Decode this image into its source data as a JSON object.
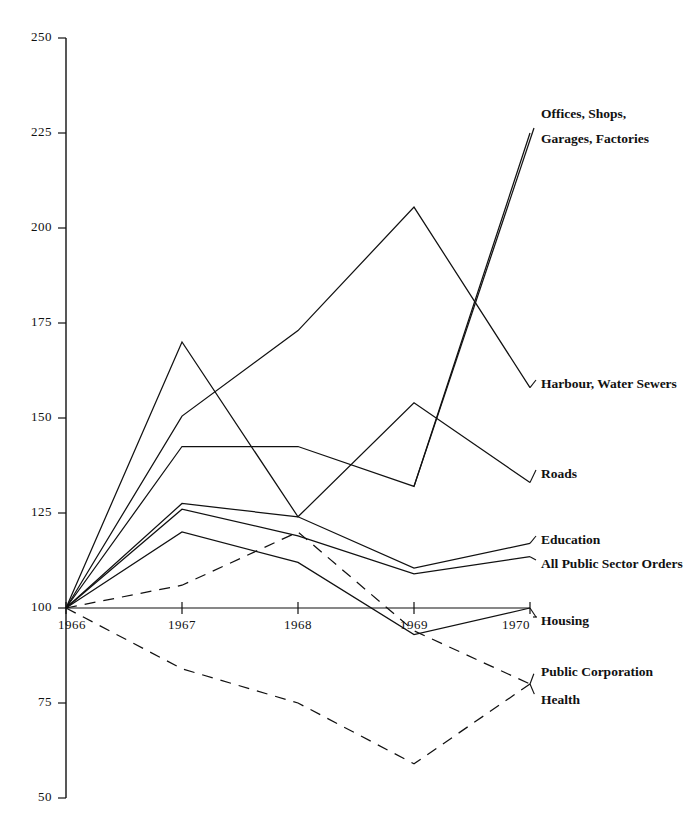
{
  "chart_data": {
    "type": "line",
    "title": "",
    "subtitle": "",
    "xlabel": "",
    "ylabel": "",
    "x": [
      "1966",
      "1967",
      "1968",
      "1969",
      "1970"
    ],
    "xlim": [
      1966,
      1970
    ],
    "ylim": [
      50,
      250
    ],
    "yticks": [
      50,
      75,
      100,
      125,
      150,
      175,
      200,
      225,
      250
    ],
    "xticks": [
      "1966",
      "1967",
      "1968",
      "1969",
      "1970"
    ],
    "grid": false,
    "legend_position": "right-inline-labels",
    "index_base": 100,
    "series": [
      {
        "name": "Offices, Shops, Garages, Factories",
        "label": "Offices, Shops,|Garages, Factories",
        "label_line1": "Offices, Shops,",
        "label_line2": "Garages, Factories",
        "style": "solid",
        "values": [
          100,
          142.5,
          142.5,
          132,
          225
        ],
        "color": "#111111"
      },
      {
        "name": "Harbour, Water Sewers",
        "label": "Harbour, Water Sewers",
        "style": "solid",
        "values": [
          100,
          150.5,
          173,
          205.5,
          158
        ],
        "color": "#111111"
      },
      {
        "name": "Roads",
        "label": "Roads",
        "style": "solid",
        "values": [
          100,
          170,
          124,
          154,
          133
        ],
        "color": "#111111"
      },
      {
        "name": "Education",
        "label": "Education",
        "style": "solid",
        "values": [
          100,
          127.5,
          124,
          110.5,
          117
        ],
        "color": "#111111"
      },
      {
        "name": "All Public Sector Orders",
        "label": "All Public Sector Orders",
        "style": "solid",
        "values": [
          100,
          126,
          119,
          109,
          113.5
        ],
        "color": "#111111"
      },
      {
        "name": "Housing",
        "label": "Housing",
        "style": "solid",
        "values": [
          100,
          120,
          112,
          93,
          100
        ],
        "color": "#111111"
      },
      {
        "name": "Public Corporation",
        "label": "Public Corporation",
        "style": "dashed",
        "values": [
          100,
          84,
          75,
          59,
          80
        ],
        "color": "#111111"
      },
      {
        "name": "Health",
        "label": "Health",
        "style": "dashed",
        "values": [
          100,
          106,
          120,
          94,
          80
        ],
        "color": "#111111"
      }
    ]
  },
  "axis": {
    "y_tick_labels": [
      "250",
      "225",
      "200",
      "175",
      "150",
      "125",
      "100",
      "75",
      "50"
    ],
    "x_tick_labels": [
      "1966",
      "1967",
      "1968",
      "1969",
      "1970"
    ]
  },
  "labels": {
    "offices_l1": "Offices, Shops,",
    "offices_l2": "Garages, Factories",
    "harbour": "Harbour, Water Sewers",
    "roads": "Roads",
    "education": "Education",
    "all_public": "All Public Sector Orders",
    "housing": "Housing",
    "public_corp": "Public Corporation",
    "health": "Health"
  }
}
